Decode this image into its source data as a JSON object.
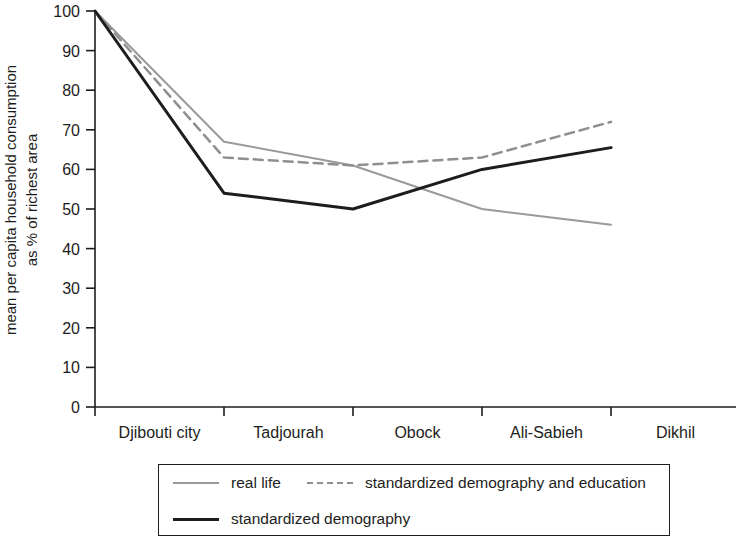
{
  "chart_data": {
    "type": "line",
    "title": "",
    "xlabel": "",
    "ylabel": "mean per capita household consumption as % of richest area",
    "ylabel_line1": "mean per capita household consumption",
    "ylabel_line2": "as % of richest area",
    "categories": [
      "Djibouti city",
      "Tadjourah",
      "Obock",
      "Ali-Sabieh",
      "Dikhil"
    ],
    "ylim": [
      0,
      100
    ],
    "yticks": [
      0,
      10,
      20,
      30,
      40,
      50,
      60,
      70,
      80,
      90,
      100
    ],
    "grid": false,
    "legend_position": "below-plot",
    "series": [
      {
        "name": "real life",
        "style": "solid",
        "color": "#9a9a9a",
        "width": 2,
        "values": [
          100,
          67,
          61,
          50,
          46
        ]
      },
      {
        "name": "standardized demography and education",
        "style": "dashed",
        "color": "#8f8f8f",
        "width": 2.5,
        "values": [
          100,
          63,
          61,
          63,
          72
        ]
      },
      {
        "name": "standardized demography",
        "style": "solid",
        "color": "#1d1d1b",
        "width": 3,
        "values": [
          100,
          54,
          50,
          60,
          65.5
        ]
      }
    ]
  },
  "legend": {
    "rows": [
      [
        {
          "label": "real life",
          "swatch": "solid-gray"
        },
        {
          "label": "standardized demography and education",
          "swatch": "dashed-gray"
        }
      ],
      [
        {
          "label": "standardized demography",
          "swatch": "solid-black"
        }
      ]
    ]
  }
}
